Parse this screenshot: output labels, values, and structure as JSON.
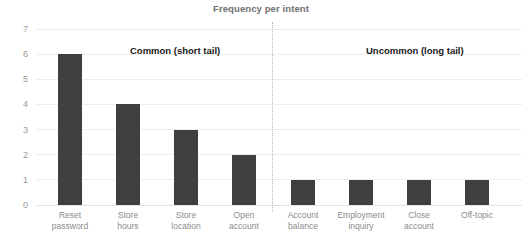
{
  "chart_data": {
    "type": "bar",
    "title": "Frequency per intent",
    "xlabel": "",
    "ylabel": "",
    "ylim": [
      0,
      7
    ],
    "yticks": [
      0,
      1,
      2,
      3,
      4,
      5,
      6,
      7
    ],
    "grid": true,
    "legend": false,
    "bar_color": "#3f3f3f",
    "categories": [
      "Reset password",
      "Store hours",
      "Store location",
      "Open account",
      "Account balance",
      "Employment inquiry",
      "Close account",
      "Off-topic"
    ],
    "values": [
      6,
      4,
      3,
      2,
      1,
      1,
      1,
      1
    ],
    "category_lines": [
      [
        "Reset",
        "password"
      ],
      [
        "Store",
        "hours"
      ],
      [
        "Store",
        "location"
      ],
      [
        "Open",
        "account"
      ],
      [
        "Account",
        "balance"
      ],
      [
        "Employment",
        "inquiry"
      ],
      [
        "Close",
        "account"
      ],
      [
        "Off-topic",
        ""
      ]
    ],
    "annotations": [
      {
        "name": "common",
        "line1": "Common",
        "line2": "(short tail)"
      },
      {
        "name": "uncommon",
        "line1": "Uncommon",
        "line2": "(long tail)"
      }
    ],
    "divider": {
      "style": "dotted",
      "color": "#b6b6b6",
      "between_categories": [
        "Open account",
        "Account balance"
      ]
    }
  }
}
